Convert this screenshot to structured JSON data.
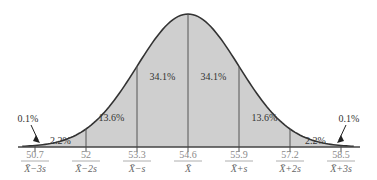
{
  "chart_data": {
    "type": "area",
    "title": "",
    "xlabel": "",
    "ylabel": "",
    "grid": false,
    "legend": "none",
    "distribution": "normal",
    "mean": 54.6,
    "sd": 1.3,
    "x_ticks": [
      {
        "value": "50.7",
        "label": "X̄−3s"
      },
      {
        "value": "52",
        "label": "X̄−2s"
      },
      {
        "value": "53.3",
        "label": "X̄−s"
      },
      {
        "value": "54.6",
        "label": "X̄"
      },
      {
        "value": "55.9",
        "label": "X̄+s"
      },
      {
        "value": "57.2",
        "label": "X̄+2s"
      },
      {
        "value": "58.5",
        "label": "X̄+3s"
      }
    ],
    "regions": [
      {
        "range": "< X̄−3s",
        "percent": "0.1%"
      },
      {
        "range": "X̄−3s to X̄−2s",
        "percent": "2.2%"
      },
      {
        "range": "X̄−2s to X̄−s",
        "percent": "13.6%"
      },
      {
        "range": "X̄−s to X̄",
        "percent": "34.1%"
      },
      {
        "range": "X̄ to X̄+s",
        "percent": "34.1%"
      },
      {
        "range": "X̄+s to X̄+2s",
        "percent": "13.6%"
      },
      {
        "range": "X̄+2s to X̄+3s",
        "percent": "2.2%"
      },
      {
        "range": "> X̄+3s",
        "percent": "0.1%"
      }
    ]
  },
  "colors": {
    "fill": "#cfcfcf",
    "curve": "#333333",
    "divider": "#555555"
  }
}
